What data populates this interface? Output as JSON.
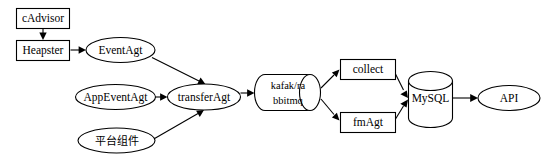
{
  "diagram": {
    "background_color": "#ffffff",
    "stroke_color": "#000000",
    "nodes": [
      {
        "id": "cadvisor",
        "label": "cAdvisor",
        "shape": "rectangle"
      },
      {
        "id": "heapster",
        "label": "Heapster",
        "shape": "rectangle"
      },
      {
        "id": "eventagt",
        "label": "EventAgt",
        "shape": "ellipse"
      },
      {
        "id": "appeventagt",
        "label": "AppEventAgt",
        "shape": "ellipse"
      },
      {
        "id": "platform",
        "label": "平台组件",
        "shape": "ellipse"
      },
      {
        "id": "transferagt",
        "label": "transferAgt",
        "shape": "ellipse"
      },
      {
        "id": "queue",
        "label_line1": "kafak/ra",
        "label_line2": "bbitmq",
        "shape": "cylinder-horizontal"
      },
      {
        "id": "collect",
        "label": "collect",
        "shape": "rectangle"
      },
      {
        "id": "fmagt",
        "label": "fmAgt",
        "shape": "rectangle"
      },
      {
        "id": "mysql",
        "label": "MySQL",
        "shape": "cylinder-vertical"
      },
      {
        "id": "api",
        "label": "API",
        "shape": "ellipse"
      }
    ],
    "edges": [
      {
        "from": "cadvisor",
        "to": "heapster"
      },
      {
        "from": "heapster",
        "to": "eventagt"
      },
      {
        "from": "eventagt",
        "to": "transferagt"
      },
      {
        "from": "appeventagt",
        "to": "transferagt"
      },
      {
        "from": "platform",
        "to": "transferagt"
      },
      {
        "from": "transferagt",
        "to": "queue"
      },
      {
        "from": "queue",
        "to": "collect"
      },
      {
        "from": "queue",
        "to": "fmagt"
      },
      {
        "from": "collect",
        "to": "mysql"
      },
      {
        "from": "fmagt",
        "to": "mysql"
      },
      {
        "from": "mysql",
        "to": "api"
      }
    ]
  }
}
